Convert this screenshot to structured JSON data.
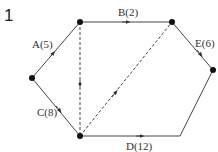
{
  "question_number": "1",
  "diagram": {
    "type": "network",
    "nodes": [
      {
        "id": "left",
        "x": 32,
        "y": 78,
        "dot": true
      },
      {
        "id": "top-left",
        "x": 80,
        "y": 22,
        "dot": true
      },
      {
        "id": "top-right",
        "x": 172,
        "y": 22,
        "dot": true
      },
      {
        "id": "right",
        "x": 213,
        "y": 70,
        "dot": true
      },
      {
        "id": "bottom-left",
        "x": 80,
        "y": 136,
        "dot": true
      },
      {
        "id": "bottom-right",
        "x": 180,
        "y": 136,
        "dot": false
      }
    ],
    "edges": [
      {
        "label": "A(5)",
        "from": "left",
        "to": "top-left",
        "style": "solid",
        "arrow": true
      },
      {
        "label": "B(2)",
        "from": "top-left",
        "to": "top-right",
        "style": "solid",
        "arrow": true
      },
      {
        "label": "E(6)",
        "from": "top-right",
        "to": "right",
        "style": "solid",
        "arrow": true
      },
      {
        "label": "C(8)",
        "from": "left",
        "to": "bottom-left",
        "style": "solid",
        "arrow": true
      },
      {
        "label": "D(12)",
        "from": "bottom-left",
        "to": "bottom-right",
        "style": "solid",
        "arrow": true
      },
      {
        "label": "",
        "from": "bottom-right",
        "to": "right",
        "style": "solid",
        "arrow": false
      },
      {
        "label": "",
        "from": "top-left",
        "to": "bottom-left",
        "style": "dashed",
        "arrow": true
      },
      {
        "label": "",
        "from": "bottom-left",
        "to": "top-right",
        "style": "dashed",
        "arrow": true
      }
    ],
    "labels": {
      "A": "A(5)",
      "B": "B(2)",
      "C": "C(8)",
      "D": "D(12)",
      "E": "E(6)"
    }
  }
}
